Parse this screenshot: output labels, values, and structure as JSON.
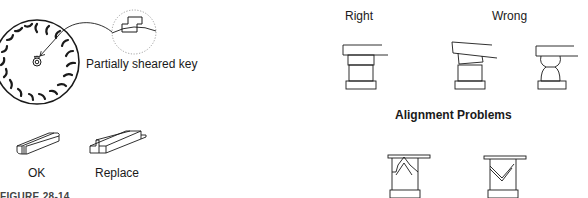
{
  "left_panel": {
    "callout_label": "Partially sheared key",
    "keys": [
      {
        "label": "OK"
      },
      {
        "label": "Replace"
      }
    ]
  },
  "right_panel": {
    "labels": {
      "right": "Right",
      "wrong": "Wrong"
    },
    "section_title": "Alignment Problems"
  },
  "caption": {
    "text": "FIGURE 28-14  ..."
  },
  "colors": {
    "line": "#1a1a1a",
    "dotted": "#888888",
    "background": "#ffffff"
  }
}
